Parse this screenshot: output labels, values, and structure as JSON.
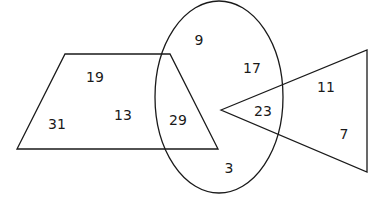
{
  "diagram": {
    "type": "venn-style overlapping shapes",
    "shapes": {
      "trapezoid": {
        "points": "65,54 170,54 218,149 17,149"
      },
      "ellipse": {
        "cx": 219,
        "cy": 97,
        "rx": 64,
        "ry": 96
      },
      "triangle": {
        "points": "221,110 367,50 367,172"
      }
    },
    "numbers": [
      {
        "label": "19",
        "x": 95,
        "y": 77,
        "region": "trapezoid only"
      },
      {
        "label": "13",
        "x": 123,
        "y": 115,
        "region": "trapezoid only"
      },
      {
        "label": "31",
        "x": 57,
        "y": 124,
        "region": "trapezoid only"
      },
      {
        "label": "29",
        "x": 178,
        "y": 120,
        "region": "trapezoid and ellipse"
      },
      {
        "label": "9",
        "x": 199,
        "y": 40,
        "region": "ellipse only"
      },
      {
        "label": "17",
        "x": 252,
        "y": 68,
        "region": "ellipse only"
      },
      {
        "label": "3",
        "x": 229,
        "y": 168,
        "region": "ellipse only"
      },
      {
        "label": "23",
        "x": 263,
        "y": 111,
        "region": "ellipse and triangle"
      },
      {
        "label": "11",
        "x": 326,
        "y": 87,
        "region": "triangle only"
      },
      {
        "label": "7",
        "x": 344,
        "y": 134,
        "region": "triangle only"
      }
    ]
  }
}
